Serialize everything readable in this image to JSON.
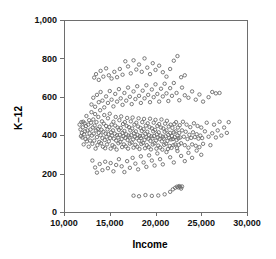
{
  "chart_data": {
    "type": "scatter",
    "title": "",
    "xlabel": "Income",
    "ylabel": "K–12",
    "xlim": [
      10000,
      30000
    ],
    "ylim": [
      0,
      1000
    ],
    "grid": false,
    "legend": null,
    "marker": {
      "shape": "open-circle",
      "radius_px": 1.7,
      "stroke_color": "#6b6b6b",
      "fill": "none"
    },
    "xticks": [
      10000,
      15000,
      20000,
      25000,
      30000
    ],
    "xticklabels": [
      "10,000",
      "15,000",
      "20,000",
      "25,000",
      "30,000"
    ],
    "yticks": [
      0,
      200,
      400,
      600,
      800,
      1000
    ],
    "yticklabels": [
      "0",
      "200",
      "400",
      "600",
      "800",
      "1,000"
    ],
    "n_points": 402,
    "points": [
      [
        11700,
        455
      ],
      [
        11800,
        430
      ],
      [
        11850,
        395
      ],
      [
        11900,
        468
      ],
      [
        11950,
        412
      ],
      [
        12000,
        388
      ],
      [
        12050,
        441
      ],
      [
        12100,
        470
      ],
      [
        12150,
        352
      ],
      [
        12200,
        405
      ],
      [
        12250,
        462
      ],
      [
        12300,
        420
      ],
      [
        12350,
        380
      ],
      [
        12400,
        448
      ],
      [
        12450,
        500
      ],
      [
        12500,
        368
      ],
      [
        12550,
        425
      ],
      [
        12600,
        392
      ],
      [
        12650,
        455
      ],
      [
        12700,
        340
      ],
      [
        12750,
        478
      ],
      [
        12800,
        410
      ],
      [
        12850,
        372
      ],
      [
        12900,
        430
      ],
      [
        12950,
        465
      ],
      [
        13000,
        520
      ],
      [
        13050,
        398
      ],
      [
        13100,
        355
      ],
      [
        13150,
        440
      ],
      [
        13200,
        482
      ],
      [
        13250,
        408
      ],
      [
        13300,
        372
      ],
      [
        13350,
        450
      ],
      [
        13400,
        510
      ],
      [
        13450,
        330
      ],
      [
        13500,
        425
      ],
      [
        13550,
        468
      ],
      [
        13600,
        390
      ],
      [
        13650,
        348
      ],
      [
        13700,
        432
      ],
      [
        13750,
        495
      ],
      [
        13800,
        412
      ],
      [
        13850,
        365
      ],
      [
        13900,
        445
      ],
      [
        13950,
        530
      ],
      [
        14000,
        400
      ],
      [
        14050,
        358
      ],
      [
        14100,
        428
      ],
      [
        14150,
        472
      ],
      [
        14200,
        385
      ],
      [
        14250,
        340
      ],
      [
        14300,
        418
      ],
      [
        14350,
        460
      ],
      [
        14400,
        505
      ],
      [
        14450,
        375
      ],
      [
        14500,
        332
      ],
      [
        14550,
        408
      ],
      [
        14600,
        448
      ],
      [
        14650,
        392
      ],
      [
        14700,
        352
      ],
      [
        14750,
        430
      ],
      [
        14800,
        488
      ],
      [
        14850,
        405
      ],
      [
        14900,
        368
      ],
      [
        14950,
        442
      ],
      [
        15000,
        512
      ],
      [
        15050,
        385
      ],
      [
        15100,
        330
      ],
      [
        15150,
        415
      ],
      [
        15200,
        455
      ],
      [
        15250,
        398
      ],
      [
        15300,
        348
      ],
      [
        15350,
        425
      ],
      [
        15400,
        470
      ],
      [
        15450,
        382
      ],
      [
        15500,
        340
      ],
      [
        15550,
        408
      ],
      [
        15600,
        450
      ],
      [
        15650,
        495
      ],
      [
        15700,
        372
      ],
      [
        15750,
        325
      ],
      [
        15800,
        400
      ],
      [
        15850,
        440
      ],
      [
        15900,
        388
      ],
      [
        15950,
        358
      ],
      [
        16000,
        428
      ],
      [
        16050,
        478
      ],
      [
        16100,
        402
      ],
      [
        16150,
        365
      ],
      [
        16200,
        438
      ],
      [
        16250,
        498
      ],
      [
        16300,
        380
      ],
      [
        16350,
        338
      ],
      [
        16400,
        412
      ],
      [
        16450,
        458
      ],
      [
        16500,
        395
      ],
      [
        16550,
        352
      ],
      [
        16600,
        422
      ],
      [
        16650,
        468
      ],
      [
        16700,
        386
      ],
      [
        16750,
        342
      ],
      [
        16800,
        405
      ],
      [
        16850,
        448
      ],
      [
        16900,
        490
      ],
      [
        16950,
        375
      ],
      [
        17000,
        330
      ],
      [
        17050,
        398
      ],
      [
        17100,
        442
      ],
      [
        17150,
        388
      ],
      [
        17200,
        356
      ],
      [
        17250,
        425
      ],
      [
        17300,
        472
      ],
      [
        17350,
        400
      ],
      [
        17400,
        362
      ],
      [
        17450,
        435
      ],
      [
        17500,
        492
      ],
      [
        17550,
        378
      ],
      [
        17600,
        335
      ],
      [
        17650,
        410
      ],
      [
        17700,
        455
      ],
      [
        17750,
        392
      ],
      [
        17800,
        350
      ],
      [
        17850,
        420
      ],
      [
        17900,
        465
      ],
      [
        17950,
        384
      ],
      [
        18000,
        340
      ],
      [
        18050,
        402
      ],
      [
        18100,
        445
      ],
      [
        18150,
        488
      ],
      [
        18200,
        372
      ],
      [
        18250,
        328
      ],
      [
        18300,
        396
      ],
      [
        18350,
        438
      ],
      [
        18400,
        385
      ],
      [
        18450,
        354
      ],
      [
        18500,
        422
      ],
      [
        18550,
        468
      ],
      [
        18600,
        398
      ],
      [
        18650,
        360
      ],
      [
        18700,
        432
      ],
      [
        18750,
        485
      ],
      [
        18800,
        375
      ],
      [
        18850,
        332
      ],
      [
        18900,
        408
      ],
      [
        18950,
        450
      ],
      [
        19000,
        390
      ],
      [
        19050,
        348
      ],
      [
        19100,
        418
      ],
      [
        19150,
        462
      ],
      [
        19200,
        382
      ],
      [
        19250,
        338
      ],
      [
        19300,
        400
      ],
      [
        19350,
        442
      ],
      [
        19400,
        486
      ],
      [
        19450,
        370
      ],
      [
        19500,
        326
      ],
      [
        19550,
        394
      ],
      [
        19600,
        436
      ],
      [
        19650,
        383
      ],
      [
        19700,
        352
      ],
      [
        19750,
        420
      ],
      [
        19800,
        465
      ],
      [
        19850,
        396
      ],
      [
        19900,
        358
      ],
      [
        19950,
        428
      ],
      [
        20000,
        480
      ],
      [
        20050,
        372
      ],
      [
        20100,
        330
      ],
      [
        20150,
        405
      ],
      [
        20200,
        448
      ],
      [
        20250,
        388
      ],
      [
        20300,
        346
      ],
      [
        20350,
        415
      ],
      [
        20400,
        458
      ],
      [
        20450,
        380
      ],
      [
        20500,
        336
      ],
      [
        20550,
        398
      ],
      [
        20600,
        440
      ],
      [
        20650,
        482
      ],
      [
        20700,
        368
      ],
      [
        20750,
        325
      ],
      [
        20800,
        392
      ],
      [
        20850,
        435
      ],
      [
        20900,
        382
      ],
      [
        20950,
        350
      ],
      [
        21000,
        418
      ],
      [
        21050,
        460
      ],
      [
        21100,
        394
      ],
      [
        21150,
        356
      ],
      [
        21200,
        425
      ],
      [
        21250,
        475
      ],
      [
        21300,
        370
      ],
      [
        21350,
        328
      ],
      [
        21400,
        402
      ],
      [
        21450,
        445
      ],
      [
        21500,
        386
      ],
      [
        21550,
        344
      ],
      [
        21600,
        412
      ],
      [
        21650,
        455
      ],
      [
        21700,
        378
      ],
      [
        21750,
        334
      ],
      [
        21800,
        396
      ],
      [
        21850,
        438
      ],
      [
        21900,
        380
      ],
      [
        21950,
        348
      ],
      [
        22000,
        415
      ],
      [
        22050,
        458
      ],
      [
        22100,
        390
      ],
      [
        22150,
        352
      ],
      [
        22200,
        420
      ],
      [
        22250,
        468
      ],
      [
        22300,
        375
      ],
      [
        22350,
        332
      ],
      [
        22400,
        398
      ],
      [
        22450,
        440
      ],
      [
        22500,
        384
      ],
      [
        22550,
        350
      ],
      [
        22600,
        412
      ],
      [
        22650,
        452
      ],
      [
        22700,
        388
      ],
      [
        22800,
        358
      ],
      [
        22900,
        425
      ],
      [
        23000,
        470
      ],
      [
        23100,
        392
      ],
      [
        23200,
        348
      ],
      [
        23300,
        418
      ],
      [
        23400,
        455
      ],
      [
        23500,
        380
      ],
      [
        23600,
        335
      ],
      [
        23700,
        402
      ],
      [
        23800,
        442
      ],
      [
        23900,
        386
      ],
      [
        24000,
        352
      ],
      [
        24100,
        415
      ],
      [
        24200,
        462
      ],
      [
        24300,
        390
      ],
      [
        24400,
        345
      ],
      [
        24500,
        405
      ],
      [
        24600,
        448
      ],
      [
        24700,
        382
      ],
      [
        24800,
        338
      ],
      [
        24900,
        398
      ],
      [
        25000,
        440
      ],
      [
        25100,
        385
      ],
      [
        25200,
        355
      ],
      [
        25400,
        420
      ],
      [
        25600,
        465
      ],
      [
        25800,
        392
      ],
      [
        26000,
        348
      ],
      [
        26200,
        410
      ],
      [
        26400,
        455
      ],
      [
        26600,
        388
      ],
      [
        26800,
        425
      ],
      [
        27000,
        470
      ],
      [
        27200,
        398
      ],
      [
        27500,
        440
      ],
      [
        27800,
        412
      ],
      [
        28000,
        468
      ],
      [
        13000,
        560
      ],
      [
        13200,
        595
      ],
      [
        13400,
        548
      ],
      [
        13600,
        610
      ],
      [
        13800,
        572
      ],
      [
        14000,
        625
      ],
      [
        14200,
        580
      ],
      [
        14400,
        545
      ],
      [
        14600,
        602
      ],
      [
        14800,
        568
      ],
      [
        15000,
        630
      ],
      [
        15200,
        585
      ],
      [
        15400,
        550
      ],
      [
        15600,
        615
      ],
      [
        15800,
        575
      ],
      [
        16000,
        640
      ],
      [
        16200,
        592
      ],
      [
        16400,
        558
      ],
      [
        16600,
        620
      ],
      [
        16800,
        580
      ],
      [
        17000,
        648
      ],
      [
        17200,
        600
      ],
      [
        17400,
        562
      ],
      [
        17600,
        628
      ],
      [
        17800,
        588
      ],
      [
        18000,
        655
      ],
      [
        18200,
        605
      ],
      [
        18400,
        568
      ],
      [
        18600,
        632
      ],
      [
        18800,
        592
      ],
      [
        19000,
        660
      ],
      [
        19200,
        610
      ],
      [
        19400,
        572
      ],
      [
        19600,
        638
      ],
      [
        19800,
        598
      ],
      [
        20000,
        665
      ],
      [
        20200,
        615
      ],
      [
        20400,
        575
      ],
      [
        20600,
        642
      ],
      [
        20800,
        602
      ],
      [
        21000,
        668
      ],
      [
        21200,
        618
      ],
      [
        21400,
        578
      ],
      [
        21600,
        645
      ],
      [
        21800,
        605
      ],
      [
        22000,
        672
      ],
      [
        22300,
        620
      ],
      [
        22600,
        582
      ],
      [
        22900,
        648
      ],
      [
        23200,
        608
      ],
      [
        23600,
        595
      ],
      [
        24000,
        628
      ],
      [
        24400,
        585
      ],
      [
        24800,
        612
      ],
      [
        25200,
        575
      ],
      [
        25800,
        598
      ],
      [
        26200,
        625
      ],
      [
        26600,
        618
      ],
      [
        27000,
        620
      ],
      [
        13300,
        700
      ],
      [
        13500,
        718
      ],
      [
        13800,
        688
      ],
      [
        14000,
        735
      ],
      [
        14300,
        705
      ],
      [
        14600,
        748
      ],
      [
        14900,
        712
      ],
      [
        15200,
        695
      ],
      [
        15500,
        730
      ],
      [
        15800,
        702
      ],
      [
        16100,
        745
      ],
      [
        16400,
        715
      ],
      [
        16700,
        785
      ],
      [
        17000,
        758
      ],
      [
        17300,
        722
      ],
      [
        17600,
        790
      ],
      [
        17900,
        742
      ],
      [
        18200,
        768
      ],
      [
        18500,
        730
      ],
      [
        18800,
        800
      ],
      [
        19100,
        752
      ],
      [
        19400,
        718
      ],
      [
        19700,
        775
      ],
      [
        20000,
        740
      ],
      [
        20400,
        762
      ],
      [
        20800,
        728
      ],
      [
        21200,
        705
      ],
      [
        21600,
        745
      ],
      [
        22000,
        788
      ],
      [
        22400,
        812
      ],
      [
        22800,
        702
      ],
      [
        23200,
        712
      ],
      [
        13100,
        268
      ],
      [
        13400,
        232
      ],
      [
        13600,
        205
      ],
      [
        13900,
        250
      ],
      [
        14200,
        218
      ],
      [
        14500,
        262
      ],
      [
        14800,
        228
      ],
      [
        15100,
        255
      ],
      [
        15400,
        212
      ],
      [
        15700,
        245
      ],
      [
        16000,
        275
      ],
      [
        16300,
        238
      ],
      [
        16600,
        208
      ],
      [
        16900,
        265
      ],
      [
        17200,
        230
      ],
      [
        17500,
        282
      ],
      [
        17800,
        252
      ],
      [
        18100,
        222
      ],
      [
        18400,
        290
      ],
      [
        18700,
        258
      ],
      [
        19000,
        235
      ],
      [
        19300,
        295
      ],
      [
        19600,
        268
      ],
      [
        19900,
        242
      ],
      [
        20200,
        305
      ],
      [
        20500,
        275
      ],
      [
        20800,
        248
      ],
      [
        21200,
        312
      ],
      [
        21600,
        285
      ],
      [
        22000,
        258
      ],
      [
        22400,
        318
      ],
      [
        22800,
        292
      ],
      [
        23200,
        265
      ],
      [
        23600,
        308
      ],
      [
        24000,
        282
      ],
      [
        24500,
        320
      ],
      [
        25000,
        298
      ],
      [
        17600,
        85
      ],
      [
        18200,
        82
      ],
      [
        18900,
        88
      ],
      [
        19600,
        84
      ],
      [
        20300,
        86
      ],
      [
        21000,
        92
      ],
      [
        21600,
        105
      ],
      [
        21900,
        118
      ],
      [
        22150,
        126
      ],
      [
        22350,
        132
      ],
      [
        22500,
        128
      ],
      [
        22600,
        135
      ],
      [
        22700,
        130
      ],
      [
        22800,
        122
      ],
      [
        22900,
        133
      ]
    ]
  }
}
